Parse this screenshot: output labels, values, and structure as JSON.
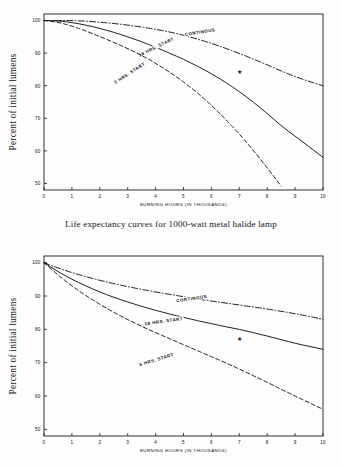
{
  "document": {
    "caption": "Life expectancy curves for 1000-watt metal halide lamp"
  },
  "chart_data": [
    {
      "id": "top",
      "type": "line",
      "title": "",
      "xlabel": "BURNING HOURS (IN THOUSANDS)",
      "ylabel": "Percent of initial lumens",
      "xlim": [
        0,
        10
      ],
      "ylim": [
        48,
        102
      ],
      "grid": false,
      "legend_position": "inline-labels",
      "xticks": [
        "0",
        "1",
        "2",
        "3",
        "4",
        "5",
        "6",
        "7",
        "8",
        "9",
        "10"
      ],
      "yticks": [
        "50",
        "60",
        "70",
        "80",
        "90",
        "100"
      ],
      "x": [
        0,
        0.5,
        1,
        1.5,
        2,
        2.5,
        3,
        3.5,
        4,
        4.5,
        5,
        5.5,
        6,
        6.5,
        7,
        7.5,
        8,
        8.5,
        9,
        9.5,
        10
      ],
      "series": [
        {
          "name": "CONTINOUS",
          "style": "dash-dot",
          "label_x": 5.6,
          "label_y": 96.0,
          "label_rotate": -9,
          "values": [
            100,
            100,
            100,
            99.8,
            99.5,
            99.1,
            98.6,
            98.0,
            97.3,
            96.5,
            95.5,
            94.3,
            93.0,
            91.5,
            89.9,
            88.2,
            86.4,
            84.5,
            82.8,
            81.3,
            80.0
          ]
        },
        {
          "name": "18 HRS. START",
          "style": "solid",
          "label_x": 4.05,
          "label_y": 91.5,
          "label_rotate": -26,
          "marker": {
            "x": 7.0,
            "y": 84.2,
            "shape": "star"
          },
          "values": [
            100,
            99.9,
            99.4,
            98.6,
            97.6,
            96.4,
            95.0,
            93.5,
            91.8,
            90.0,
            88.1,
            86.0,
            83.7,
            81.1,
            78.2,
            75.0,
            71.5,
            67.7,
            64.5,
            61.3,
            58.0
          ]
        },
        {
          "name": "5 HRS. START",
          "style": "dashed",
          "label_x": 3.1,
          "label_y": 83.5,
          "label_rotate": -33,
          "values": [
            100,
            99.5,
            98.3,
            96.8,
            95.1,
            93.3,
            91.4,
            89.3,
            86.9,
            84.2,
            81.2,
            77.8,
            74.0,
            69.8,
            65.2,
            60.2,
            54.8,
            49.2,
            null,
            null,
            null
          ]
        }
      ]
    },
    {
      "id": "bottom",
      "type": "line",
      "title": "",
      "xlabel": "BURNING HOURS (IN THOUSANDS)",
      "ylabel": "Percent of initial lumens",
      "xlim": [
        0,
        10
      ],
      "ylim": [
        48,
        102
      ],
      "grid": false,
      "legend_position": "inline-labels",
      "xticks": [
        "0",
        "1",
        "2",
        "3",
        "4",
        "5",
        "6",
        "7",
        "8",
        "9",
        "10"
      ],
      "yticks": [
        "50",
        "60",
        "70",
        "80",
        "90",
        "100"
      ],
      "x": [
        0,
        0.5,
        1,
        1.5,
        2,
        2.5,
        3,
        3.5,
        4,
        4.5,
        5,
        5.5,
        6,
        6.5,
        7,
        7.5,
        8,
        8.5,
        9,
        9.5,
        10
      ],
      "series": [
        {
          "name": "CONTINOUS",
          "style": "dash-dot",
          "label_x": 5.3,
          "label_y": 88.8,
          "label_rotate": -8,
          "values": [
            100,
            98.4,
            97.0,
            95.8,
            94.7,
            93.7,
            92.8,
            92.0,
            91.2,
            90.5,
            89.8,
            89.1,
            88.5,
            87.9,
            87.3,
            86.7,
            86.1,
            85.4,
            84.7,
            83.9,
            83.0
          ]
        },
        {
          "name": "18 HRS. START",
          "style": "solid",
          "label_x": 4.3,
          "label_y": 82.0,
          "label_rotate": -8,
          "marker": {
            "x": 7.0,
            "y": 77.2,
            "shape": "star"
          },
          "values": [
            100,
            97.3,
            95.0,
            93.0,
            91.2,
            89.6,
            88.2,
            86.9,
            85.7,
            84.6,
            83.6,
            82.6,
            81.7,
            80.8,
            80.0,
            79.0,
            78.0,
            76.9,
            75.8,
            74.9,
            74.0
          ]
        },
        {
          "name": "5 HRS. START",
          "style": "dashed",
          "label_x": 4.05,
          "label_y": 70.5,
          "label_rotate": -17,
          "values": [
            100,
            96.3,
            93.0,
            90.1,
            87.5,
            85.1,
            82.9,
            80.9,
            79.0,
            77.2,
            75.4,
            73.6,
            71.8,
            70.0,
            68.1,
            66.1,
            64.1,
            62.0,
            60.0,
            58.0,
            56.0
          ]
        }
      ]
    }
  ]
}
